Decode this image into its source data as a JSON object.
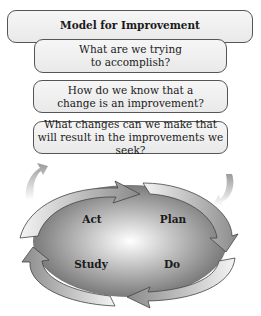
{
  "title": "Model for Improvement",
  "questions": [
    {
      "text": "What are we trying\nto accomplish?"
    },
    {
      "text": "How do we know that a\nchange is an improvement?"
    },
    {
      "text": "What changes can we make that\nwill result in the improvements we seek?"
    }
  ],
  "cycle": {
    "quadrants": [
      {
        "label": "Act"
      },
      {
        "label": "Plan"
      },
      {
        "label": "Study"
      },
      {
        "label": "Do"
      }
    ],
    "colors": {
      "dark": "#6e6e6e",
      "light": "#ffffff",
      "arrow_stroke": "#444444"
    }
  }
}
